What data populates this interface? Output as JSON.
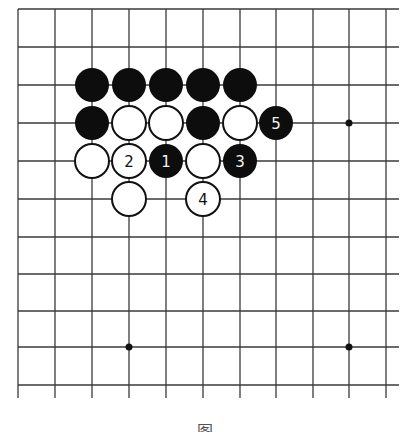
{
  "diagram": {
    "type": "go-board-fragment",
    "line_color": "#3a3a3a",
    "grid": {
      "columns_x": [
        18,
        55,
        92,
        129,
        166,
        203,
        240,
        276,
        313,
        349,
        386
      ],
      "rows_y": [
        9,
        47,
        85,
        123,
        161,
        199,
        237,
        274,
        311,
        347,
        385
      ],
      "right_extend_to": 399,
      "bottom_extend_to": 398,
      "closed_edges": [
        "top",
        "left"
      ]
    },
    "star_points": [
      {
        "col": 9,
        "row": 3
      },
      {
        "col": 3,
        "row": 9
      },
      {
        "col": 9,
        "row": 9
      }
    ],
    "stone_radius": 17,
    "stones": [
      {
        "color": "black",
        "col": 2,
        "row": 2,
        "label": ""
      },
      {
        "color": "black",
        "col": 3,
        "row": 2,
        "label": ""
      },
      {
        "color": "black",
        "col": 4,
        "row": 2,
        "label": ""
      },
      {
        "color": "black",
        "col": 5,
        "row": 2,
        "label": ""
      },
      {
        "color": "black",
        "col": 6,
        "row": 2,
        "label": ""
      },
      {
        "color": "black",
        "col": 2,
        "row": 3,
        "label": ""
      },
      {
        "color": "white",
        "col": 3,
        "row": 3,
        "label": ""
      },
      {
        "color": "white",
        "col": 4,
        "row": 3,
        "label": ""
      },
      {
        "color": "black",
        "col": 5,
        "row": 3,
        "label": ""
      },
      {
        "color": "white",
        "col": 6,
        "row": 3,
        "label": ""
      },
      {
        "color": "black",
        "col": 7,
        "row": 3,
        "label": "5"
      },
      {
        "color": "white",
        "col": 2,
        "row": 4,
        "label": ""
      },
      {
        "color": "white",
        "col": 3,
        "row": 4,
        "label": "2"
      },
      {
        "color": "black",
        "col": 4,
        "row": 4,
        "label": "1"
      },
      {
        "color": "white",
        "col": 5,
        "row": 4,
        "label": ""
      },
      {
        "color": "black",
        "col": 6,
        "row": 4,
        "label": "3"
      },
      {
        "color": "white",
        "col": 3,
        "row": 5,
        "label": ""
      },
      {
        "color": "white",
        "col": 5,
        "row": 5,
        "label": "4"
      }
    ],
    "caption": "图"
  }
}
